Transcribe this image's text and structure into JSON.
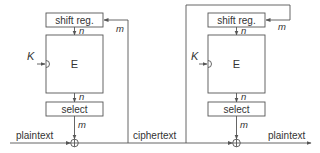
{
  "diagram": {
    "colors": {
      "stroke": "#555555",
      "text": "#333333",
      "background": "#ffffff"
    },
    "encrypt": {
      "shift_reg_label": "shift reg.",
      "cipher_label": "E",
      "select_label": "select",
      "key_label": "K",
      "n_top_label": "n",
      "n_bottom_label": "n",
      "m_select_label": "m",
      "m_feedback_label": "m",
      "input_label": "plaintext"
    },
    "channel_label": "ciphertext",
    "decrypt": {
      "shift_reg_label": "shift reg.",
      "cipher_label": "E",
      "select_label": "select",
      "key_label": "K",
      "n_top_label": "n",
      "n_bottom_label": "n",
      "m_select_label": "m",
      "m_feedback_label": "m",
      "output_label": "plaintext"
    }
  }
}
